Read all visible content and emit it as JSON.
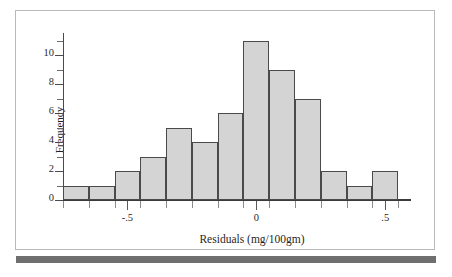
{
  "figure": {
    "background_color": "#ffffff",
    "frame_color": "#b9b9b9",
    "rule_color": "#6f6f6f"
  },
  "chart_data": {
    "type": "bar",
    "title": "",
    "subtitle": "",
    "xlabel": "Residuals (mg/100gm)",
    "ylabel": "Frequency",
    "bar_fill_color": "#d4d4d4",
    "bar_edge_color": "#4a4a4a",
    "grid": false,
    "legend": null,
    "xlim": [
      -0.75,
      0.6
    ],
    "ylim": [
      0,
      11.6
    ],
    "bin_width": 0.1,
    "bin_edges": [
      -0.75,
      -0.65,
      -0.55,
      -0.45,
      -0.35,
      -0.25,
      -0.15,
      -0.05,
      0.05,
      0.15,
      0.25,
      0.35,
      0.45,
      0.55
    ],
    "bin_centers": [
      -0.7,
      -0.6,
      -0.5,
      -0.4,
      -0.3,
      -0.2,
      -0.1,
      0.0,
      0.1,
      0.2,
      0.3,
      0.4,
      0.5
    ],
    "values": [
      1,
      1,
      2,
      3,
      5,
      4,
      6,
      11,
      9,
      7,
      2,
      1,
      2
    ],
    "categories": [
      "-0.70",
      "-0.60",
      "-0.50",
      "-0.40",
      "-0.30",
      "-0.20",
      "-0.10",
      "0.00",
      "0.10",
      "0.20",
      "0.30",
      "0.40",
      "0.50"
    ],
    "total_count": 50,
    "y_ticks_major": [
      0,
      2,
      4,
      6,
      8,
      10
    ],
    "y_ticks_minor": [
      1,
      3,
      5,
      7,
      9,
      11
    ],
    "y_tick_labels": [
      "0",
      "2",
      "4",
      "6",
      "8",
      "10"
    ],
    "x_ticks": [
      -0.75,
      -0.65,
      -0.55,
      -0.45,
      -0.35,
      -0.25,
      -0.15,
      -0.05,
      0.05,
      0.15,
      0.25,
      0.35,
      0.45,
      0.55
    ],
    "x_labeled_ticks": [
      -0.5,
      0,
      0.5
    ],
    "x_tick_labels": [
      "-.5",
      "0",
      ".5"
    ]
  }
}
